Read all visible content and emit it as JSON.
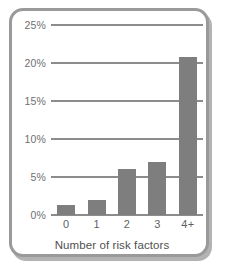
{
  "chart_data": {
    "type": "bar",
    "title": "",
    "xlabel": "Number of risk factors",
    "ylabel": "",
    "categories": [
      "0",
      "1",
      "2",
      "3",
      "4+"
    ],
    "values": [
      1.3,
      2.0,
      6.0,
      7.0,
      20.8
    ],
    "value_unit": "%",
    "ylim": [
      0,
      25
    ],
    "ytick_values": [
      0,
      5,
      10,
      15,
      20,
      25
    ],
    "ytick_labels": [
      "0%",
      "5%",
      "10%",
      "15%",
      "20%",
      "25%"
    ],
    "grid": true,
    "legend": null,
    "colors": {
      "bar": "#7e7e7e",
      "gridline": "#8c8c8c",
      "frame": "#9a9a9a",
      "frame_shadow": "#b3b3b3",
      "tick_text": "#6f6f6f",
      "axis_title": "#4f4f4f",
      "background": "#ffffff"
    }
  }
}
